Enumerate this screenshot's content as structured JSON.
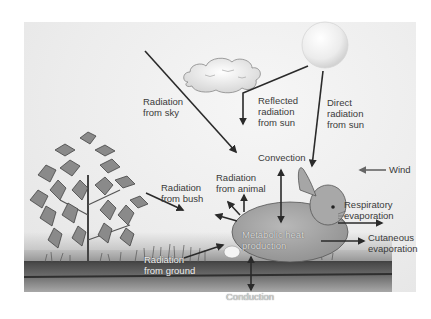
{
  "diagram": {
    "labels": {
      "radiation_from_sky": "Radiation\nfrom sky",
      "reflected_radiation_from_sun": "Reflected\nradiation\nfrom sun",
      "direct_radiation_from_sun": "Direct\nradiation\nfrom sun",
      "convection": "Convection",
      "wind": "Wind",
      "radiation_from_bush": "Radiation\nfrom bush",
      "radiation_from_animal": "Radiation\nfrom animal",
      "respiratory_evaporation": "Respiratory\nevaporation",
      "cutaneous_evaporation": "Cutaneous\nevaporation",
      "metabolic_heat_production": "Metabolic heat\nproduction",
      "radiation_from_ground": "Radiation\nfrom ground",
      "conduction": "Conduction"
    },
    "elements": [
      "sun",
      "cloud",
      "bush",
      "grass",
      "rabbit",
      "ground"
    ],
    "colors": {
      "arrow": "#2a2a2a",
      "background": "#ececec",
      "ground_dark": "#3f3f3f",
      "sun": "#f4f4f4",
      "bush": "#8a8a8a"
    }
  }
}
